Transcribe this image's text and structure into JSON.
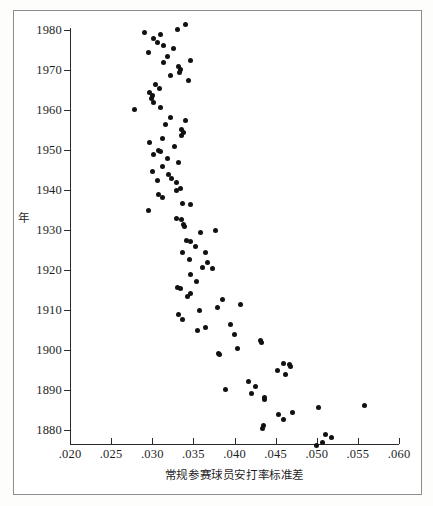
{
  "chart_data": {
    "type": "scatter",
    "title": "",
    "xlabel": "常规参赛球员安打率标准差",
    "ylabel": "年",
    "xlim": [
      0.02,
      0.06
    ],
    "ylim": [
      1874,
      1982
    ],
    "grid": false,
    "legend": null,
    "xticks": [
      ".020",
      ".025",
      ".030",
      ".035",
      ".040",
      ".045",
      ".050",
      ".055",
      ".060"
    ],
    "xtick_values": [
      0.02,
      0.025,
      0.03,
      0.035,
      0.04,
      0.045,
      0.05,
      0.055,
      0.06
    ],
    "yticks": [
      "1980",
      "1970",
      "1960",
      "1950",
      "1940",
      "1930",
      "1920",
      "1910",
      "1900",
      "1890",
      "1880"
    ],
    "ytick_values": [
      1980,
      1970,
      1960,
      1950,
      1940,
      1930,
      1920,
      1910,
      1900,
      1890,
      1880
    ],
    "y_axis_inverted": true,
    "marker": {
      "shape": "circle",
      "color": "#111111",
      "size": 5
    },
    "points": [
      {
        "x": 0.034,
        "y": 1981.5
      },
      {
        "x": 0.0331,
        "y": 1980.2
      },
      {
        "x": 0.029,
        "y": 1979.5
      },
      {
        "x": 0.031,
        "y": 1978.8
      },
      {
        "x": 0.0302,
        "y": 1978.0
      },
      {
        "x": 0.0306,
        "y": 1976.8
      },
      {
        "x": 0.0314,
        "y": 1976.2
      },
      {
        "x": 0.0326,
        "y": 1975.5
      },
      {
        "x": 0.0296,
        "y": 1974.3
      },
      {
        "x": 0.0318,
        "y": 1973.5
      },
      {
        "x": 0.0346,
        "y": 1972.3
      },
      {
        "x": 0.0314,
        "y": 1971.8
      },
      {
        "x": 0.0332,
        "y": 1971.0
      },
      {
        "x": 0.0334,
        "y": 1970.2
      },
      {
        "x": 0.0333,
        "y": 1969.5
      },
      {
        "x": 0.0322,
        "y": 1968.6
      },
      {
        "x": 0.0344,
        "y": 1967.5
      },
      {
        "x": 0.0304,
        "y": 1966.4
      },
      {
        "x": 0.0309,
        "y": 1965.3
      },
      {
        "x": 0.0297,
        "y": 1964.5
      },
      {
        "x": 0.03,
        "y": 1963.6
      },
      {
        "x": 0.0299,
        "y": 1962.8
      },
      {
        "x": 0.0302,
        "y": 1962.0
      },
      {
        "x": 0.031,
        "y": 1960.6
      },
      {
        "x": 0.0279,
        "y": 1960.1
      },
      {
        "x": 0.0322,
        "y": 1958.2
      },
      {
        "x": 0.034,
        "y": 1957.3
      },
      {
        "x": 0.0316,
        "y": 1956.3
      },
      {
        "x": 0.0336,
        "y": 1955.2
      },
      {
        "x": 0.0338,
        "y": 1954.3
      },
      {
        "x": 0.0336,
        "y": 1953.6
      },
      {
        "x": 0.0313,
        "y": 1952.8
      },
      {
        "x": 0.0297,
        "y": 1952.0
      },
      {
        "x": 0.0327,
        "y": 1951.0
      },
      {
        "x": 0.0308,
        "y": 1950.0
      },
      {
        "x": 0.031,
        "y": 1949.6
      },
      {
        "x": 0.0302,
        "y": 1948.8
      },
      {
        "x": 0.0319,
        "y": 1948.0
      },
      {
        "x": 0.0332,
        "y": 1947.0
      },
      {
        "x": 0.0312,
        "y": 1945.8
      },
      {
        "x": 0.03,
        "y": 1944.6
      },
      {
        "x": 0.032,
        "y": 1944.0
      },
      {
        "x": 0.0323,
        "y": 1943.0
      },
      {
        "x": 0.0306,
        "y": 1942.4
      },
      {
        "x": 0.033,
        "y": 1941.8
      },
      {
        "x": 0.0334,
        "y": 1940.5
      },
      {
        "x": 0.0329,
        "y": 1939.8
      },
      {
        "x": 0.0307,
        "y": 1938.9
      },
      {
        "x": 0.0312,
        "y": 1938.2
      },
      {
        "x": 0.0337,
        "y": 1936.6
      },
      {
        "x": 0.0347,
        "y": 1936.3
      },
      {
        "x": 0.0296,
        "y": 1934.8
      },
      {
        "x": 0.033,
        "y": 1933.0
      },
      {
        "x": 0.0335,
        "y": 1932.6
      },
      {
        "x": 0.0338,
        "y": 1931.4
      },
      {
        "x": 0.0339,
        "y": 1930.8
      },
      {
        "x": 0.0377,
        "y": 1930.0
      },
      {
        "x": 0.0359,
        "y": 1929.3
      },
      {
        "x": 0.0342,
        "y": 1927.5
      },
      {
        "x": 0.0347,
        "y": 1927.2
      },
      {
        "x": 0.0352,
        "y": 1926.0
      },
      {
        "x": 0.0337,
        "y": 1924.5
      },
      {
        "x": 0.0365,
        "y": 1924.4
      },
      {
        "x": 0.0345,
        "y": 1922.6
      },
      {
        "x": 0.0367,
        "y": 1922.0
      },
      {
        "x": 0.0361,
        "y": 1920.6
      },
      {
        "x": 0.0373,
        "y": 1920.3
      },
      {
        "x": 0.0347,
        "y": 1918.8
      },
      {
        "x": 0.0354,
        "y": 1917.2
      },
      {
        "x": 0.0331,
        "y": 1915.6
      },
      {
        "x": 0.0334,
        "y": 1915.4
      },
      {
        "x": 0.0346,
        "y": 1914.2
      },
      {
        "x": 0.0343,
        "y": 1913.4
      },
      {
        "x": 0.0386,
        "y": 1912.6
      },
      {
        "x": 0.0407,
        "y": 1911.4
      },
      {
        "x": 0.0379,
        "y": 1910.6
      },
      {
        "x": 0.0357,
        "y": 1909.8
      },
      {
        "x": 0.0332,
        "y": 1908.8
      },
      {
        "x": 0.0337,
        "y": 1907.7
      },
      {
        "x": 0.0395,
        "y": 1906.5
      },
      {
        "x": 0.0365,
        "y": 1905.6
      },
      {
        "x": 0.0355,
        "y": 1904.8
      },
      {
        "x": 0.04,
        "y": 1904.0
      },
      {
        "x": 0.0432,
        "y": 1902.4
      },
      {
        "x": 0.0433,
        "y": 1902.0
      },
      {
        "x": 0.0404,
        "y": 1900.5
      },
      {
        "x": 0.038,
        "y": 1899.2
      },
      {
        "x": 0.0382,
        "y": 1898.8
      },
      {
        "x": 0.046,
        "y": 1896.6
      },
      {
        "x": 0.0467,
        "y": 1896.4
      },
      {
        "x": 0.0468,
        "y": 1895.8
      },
      {
        "x": 0.0452,
        "y": 1894.8
      },
      {
        "x": 0.0462,
        "y": 1894.0
      },
      {
        "x": 0.0417,
        "y": 1892.2
      },
      {
        "x": 0.0426,
        "y": 1891.0
      },
      {
        "x": 0.0389,
        "y": 1890.2
      },
      {
        "x": 0.0421,
        "y": 1889.2
      },
      {
        "x": 0.0437,
        "y": 1888.2
      },
      {
        "x": 0.0437,
        "y": 1887.6
      },
      {
        "x": 0.0558,
        "y": 1886.2
      },
      {
        "x": 0.0502,
        "y": 1885.6
      },
      {
        "x": 0.047,
        "y": 1884.4
      },
      {
        "x": 0.0453,
        "y": 1884.0
      },
      {
        "x": 0.0459,
        "y": 1882.6
      },
      {
        "x": 0.0435,
        "y": 1881.2
      },
      {
        "x": 0.0434,
        "y": 1880.4
      },
      {
        "x": 0.0511,
        "y": 1879.0
      },
      {
        "x": 0.0518,
        "y": 1878.2
      },
      {
        "x": 0.0507,
        "y": 1877.0
      },
      {
        "x": 0.05,
        "y": 1876.2
      }
    ]
  }
}
